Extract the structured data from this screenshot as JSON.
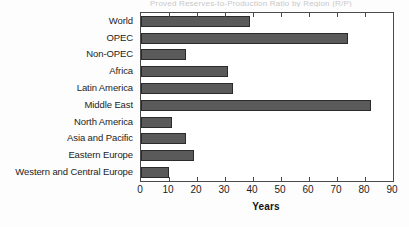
{
  "figure": {
    "caption_cutoff": "Proved Reserves-to-Production Ratio by Region (R/P)"
  },
  "chart_data": {
    "type": "bar",
    "orientation": "horizontal",
    "title": "",
    "xlabel": "Years",
    "ylabel": "",
    "xlim": [
      0,
      90
    ],
    "xticks": [
      0,
      10,
      20,
      30,
      40,
      50,
      60,
      70,
      80,
      90
    ],
    "grid": false,
    "legend": null,
    "bar_color": "#5a5a5a",
    "bar_edge_color": "#2b2b2b",
    "plot_background": "#ffffff",
    "axis_color": "#4a4a4a",
    "categories": [
      "World",
      "OPEC",
      "Non-OPEC",
      "Africa",
      "Latin America",
      "Middle East",
      "North America",
      "Asia and Pacific",
      "Eastern Europe",
      "Western and Central Europe"
    ],
    "values": [
      39,
      74,
      16,
      31,
      33,
      82,
      11,
      16,
      19,
      10
    ]
  }
}
